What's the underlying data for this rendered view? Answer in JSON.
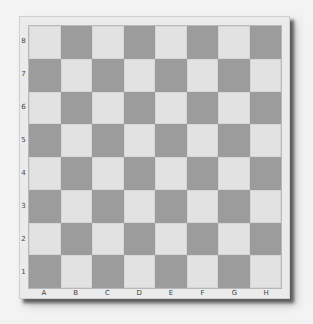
{
  "board": {
    "size": 8,
    "files": [
      "A",
      "B",
      "C",
      "D",
      "E",
      "F",
      "G",
      "H"
    ],
    "ranks": [
      "8",
      "7",
      "6",
      "5",
      "4",
      "3",
      "2",
      "1"
    ],
    "colors": {
      "light_square": "#e2e2e2",
      "dark_square": "#9c9c9c",
      "frame": "#ebebeb",
      "background": "#f3f3f3"
    },
    "pieces": []
  }
}
